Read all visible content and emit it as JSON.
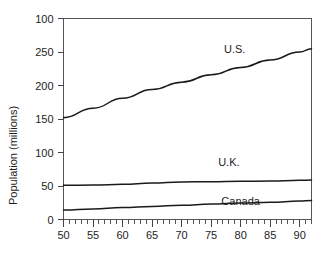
{
  "chart_data": {
    "type": "line",
    "title": "",
    "subtitle": "",
    "xlabel": "",
    "ylabel": "Population (millions)",
    "xlim": [
      50,
      92
    ],
    "ylim": [
      0,
      300
    ],
    "grid": false,
    "legend_position": "inline-annotations",
    "x_tick_labels": [
      "50",
      "55",
      "60",
      "65",
      "70",
      "75",
      "80",
      "85",
      "90"
    ],
    "x_tick_values": [
      50,
      55,
      60,
      65,
      70,
      75,
      80,
      85,
      90
    ],
    "x_minor_tick_step": 1,
    "y_tick_labels": [
      "0",
      "50",
      "100",
      "150",
      "200",
      "250",
      "100"
    ],
    "y_tick_values": [
      0,
      50,
      100,
      150,
      200,
      250,
      300
    ],
    "annotations": [
      {
        "text": "U.S.",
        "x": 79,
        "y": 248
      },
      {
        "text": "U.K.",
        "x": 78,
        "y": 80
      },
      {
        "text": "Canada",
        "x": 80,
        "y": 22
      }
    ],
    "series": [
      {
        "name": "U.S.",
        "label": "U.S.",
        "color": "#1a1a1a",
        "x": [
          50,
          55,
          60,
          65,
          70,
          75,
          80,
          85,
          90,
          92
        ],
        "values": [
          152,
          166,
          181,
          194,
          205,
          216,
          227,
          238,
          250,
          255
        ]
      },
      {
        "name": "U.K.",
        "label": "U.K.",
        "color": "#1a1a1a",
        "x": [
          50,
          55,
          60,
          65,
          70,
          75,
          80,
          85,
          90,
          92
        ],
        "values": [
          51,
          51.5,
          52.5,
          54.5,
          56,
          56.5,
          57,
          57.5,
          58.5,
          59
        ]
      },
      {
        "name": "Canada",
        "label": "Canada",
        "color": "#1a1a1a",
        "x": [
          50,
          55,
          60,
          65,
          70,
          75,
          80,
          85,
          90,
          92
        ],
        "values": [
          14,
          15.7,
          17.8,
          19.5,
          21.3,
          23,
          24.5,
          25.8,
          27.5,
          28.3
        ]
      }
    ]
  }
}
